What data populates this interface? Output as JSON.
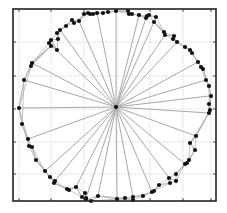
{
  "figure": {
    "type": "polygon-star-diagram",
    "frame": {
      "left": 13,
      "top": 9,
      "right": 216,
      "bottom": 201
    },
    "grid_x": [
      19,
      51,
      84,
      117,
      150,
      183,
      211
    ],
    "grid_y": [
      42,
      76,
      109,
      142,
      174
    ],
    "center": {
      "x": 116,
      "y": 107
    },
    "colors": {
      "frame": "#222222",
      "grid": "#cfcfcf",
      "spoke": "#a8a8a8",
      "polygon": "#b5b5b5",
      "point": "#111111"
    }
  },
  "chart_data": {
    "type": "scatter",
    "title": "",
    "xlabel": "",
    "ylabel": "",
    "grid": true,
    "center": [
      116,
      107
    ],
    "points": [
      [
        116,
        11
      ],
      [
        108,
        12
      ],
      [
        103,
        13
      ],
      [
        97,
        13
      ],
      [
        93,
        14
      ],
      [
        90,
        14
      ],
      [
        88,
        13
      ],
      [
        84,
        14
      ],
      [
        79,
        21
      ],
      [
        74,
        23
      ],
      [
        72,
        20
      ],
      [
        66,
        26
      ],
      [
        60,
        30
      ],
      [
        57,
        33
      ],
      [
        51,
        40
      ],
      [
        49,
        43
      ],
      [
        51,
        46
      ],
      [
        58,
        39
      ],
      [
        57,
        50
      ],
      [
        32,
        63
      ],
      [
        31,
        66
      ],
      [
        24,
        80
      ],
      [
        19,
        108
      ],
      [
        22,
        124
      ],
      [
        28,
        139
      ],
      [
        29,
        146
      ],
      [
        32,
        147
      ],
      [
        36,
        160
      ],
      [
        45,
        171
      ],
      [
        50,
        177
      ],
      [
        54,
        183
      ],
      [
        55,
        181
      ],
      [
        67,
        189
      ],
      [
        69,
        190
      ],
      [
        76,
        187
      ],
      [
        82,
        197
      ],
      [
        86,
        198
      ],
      [
        85,
        193
      ],
      [
        86,
        199
      ],
      [
        91,
        201
      ],
      [
        98,
        196
      ],
      [
        117,
        199
      ],
      [
        125,
        198
      ],
      [
        133,
        197
      ],
      [
        133,
        200
      ],
      [
        143,
        196
      ],
      [
        152,
        192
      ],
      [
        154,
        191
      ],
      [
        159,
        185
      ],
      [
        169,
        178
      ],
      [
        170,
        183
      ],
      [
        176,
        181
      ],
      [
        176,
        174
      ],
      [
        185,
        164
      ],
      [
        187,
        163
      ],
      [
        189,
        160
      ],
      [
        195,
        150
      ],
      [
        190,
        143
      ],
      [
        196,
        136
      ],
      [
        209,
        113
      ],
      [
        210,
        110
      ],
      [
        209,
        104
      ],
      [
        211,
        96
      ],
      [
        209,
        86
      ],
      [
        206,
        80
      ],
      [
        203,
        69
      ],
      [
        201,
        67
      ],
      [
        198,
        62
      ],
      [
        192,
        53
      ],
      [
        190,
        50
      ],
      [
        185,
        47
      ],
      [
        177,
        42
      ],
      [
        173,
        39
      ],
      [
        174,
        36
      ],
      [
        165,
        35
      ],
      [
        164,
        32
      ],
      [
        154,
        22
      ],
      [
        156,
        17
      ],
      [
        146,
        18
      ],
      [
        149,
        15
      ],
      [
        139,
        15
      ],
      [
        129,
        14
      ],
      [
        128,
        11
      ],
      [
        132,
        14
      ],
      [
        147,
        16
      ]
    ],
    "spoke_targets": [
      [
        116,
        11
      ],
      [
        97,
        13
      ],
      [
        79,
        21
      ],
      [
        60,
        30
      ],
      [
        49,
        43
      ],
      [
        32,
        63
      ],
      [
        24,
        80
      ],
      [
        19,
        108
      ],
      [
        28,
        139
      ],
      [
        45,
        171
      ],
      [
        55,
        181
      ],
      [
        76,
        187
      ],
      [
        86,
        198
      ],
      [
        98,
        196
      ],
      [
        117,
        199
      ],
      [
        133,
        197
      ],
      [
        152,
        192
      ],
      [
        169,
        178
      ],
      [
        185,
        164
      ],
      [
        196,
        136
      ],
      [
        209,
        113
      ],
      [
        209,
        96
      ],
      [
        206,
        80
      ],
      [
        198,
        62
      ],
      [
        177,
        42
      ],
      [
        165,
        35
      ],
      [
        154,
        22
      ],
      [
        146,
        18
      ],
      [
        139,
        15
      ]
    ]
  }
}
